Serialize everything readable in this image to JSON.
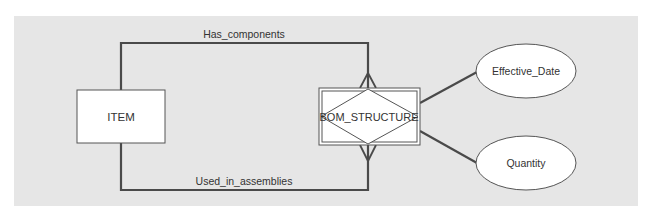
{
  "diagram": {
    "type": "ER diagram",
    "entities": [
      {
        "name": "ITEM",
        "kind": "entity"
      },
      {
        "name": "BOM_STRUCTURE",
        "kind": "associative-entity"
      }
    ],
    "attributes": [
      {
        "name": "Effective_Date",
        "of": "BOM_STRUCTURE"
      },
      {
        "name": "Quantity",
        "of": "BOM_STRUCTURE"
      }
    ],
    "relationships": [
      {
        "label": "Has_components",
        "from": "ITEM",
        "to": "BOM_STRUCTURE",
        "to_cardinality": "many"
      },
      {
        "label": "Used_in_assemblies",
        "from": "ITEM",
        "to": "BOM_STRUCTURE",
        "to_cardinality": "many"
      }
    ]
  },
  "colors": {
    "panel": "#e6e6e6",
    "line": "#4a4a4a",
    "box_fill": "#ffffff"
  }
}
